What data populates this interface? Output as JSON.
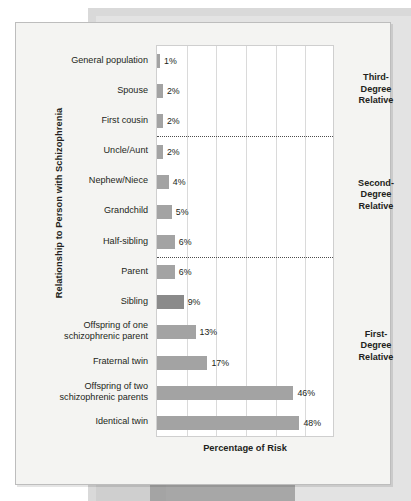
{
  "chart_data": {
    "type": "bar",
    "orientation": "horizontal",
    "title": "",
    "xlabel": "Percentage of Risk",
    "ylabel": "Relationship to Person with Schizophrenia",
    "xlim": [
      0,
      60
    ],
    "grid": true,
    "gridlines": [
      0,
      10,
      20,
      30,
      40,
      50,
      60
    ],
    "legend": "none",
    "categories": [
      "General population",
      "Spouse",
      "First cousin",
      "Uncle/Aunt",
      "Nephew/Niece",
      "Grandchild",
      "Half-sibling",
      "Parent",
      "Sibling",
      "Offspring of one\nschizophrenic parent",
      "Fraternal twin",
      "Offspring of two\nschizophrenic parents",
      "Identical twin"
    ],
    "values": [
      1,
      2,
      2,
      2,
      4,
      5,
      6,
      6,
      9,
      13,
      17,
      46,
      48
    ],
    "value_labels": [
      "1%",
      "2%",
      "2%",
      "2%",
      "4%",
      "5%",
      "6%",
      "6%",
      "9%",
      "13%",
      "17%",
      "46%",
      "48%"
    ],
    "groups": [
      {
        "label": "Third-\nDegree\nRelative",
        "categories": [
          "General population",
          "Spouse",
          "First cousin"
        ]
      },
      {
        "label": "Second-\nDegree\nRelative",
        "categories": [
          "Uncle/Aunt",
          "Nephew/Niece",
          "Grandchild",
          "Half-sibling"
        ]
      },
      {
        "label": "First-\nDegree\nRelative",
        "categories": [
          "Parent",
          "Sibling",
          "Offspring of one schizophrenic parent",
          "Fraternal twin",
          "Offspring of two schizophrenic parents",
          "Identical twin"
        ]
      }
    ],
    "colors": {
      "bar": "#a3a3a3",
      "bar_highlight": "#8a8a8a",
      "plot_background": "#ffffff",
      "card_background": "#f4f4f2",
      "grid": "#dadada",
      "text": "#231f20"
    }
  },
  "axes": {
    "y_title": "Relationship to Person with Schizophrenia",
    "x_title": "Percentage of Risk"
  },
  "group_labels": {
    "third": "Third-\nDegree\nRelative",
    "second": "Second-\nDegree\nRelative",
    "first": "First-\nDegree\nRelative"
  }
}
